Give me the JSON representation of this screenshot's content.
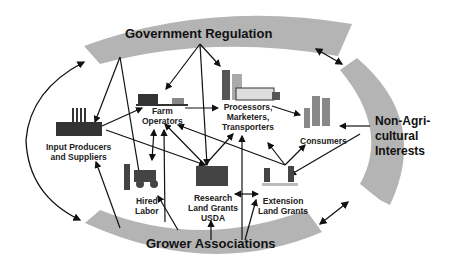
{
  "diagram": {
    "outer_groups": {
      "government": "Government Regulation",
      "grower": "Grower Associations",
      "non_ag_line1": "Non-Agri-",
      "non_ag_line2": "cultural",
      "non_ag_line3": "Interests"
    },
    "nodes": {
      "input_line1": "Input Producers",
      "input_line2": "and Suppliers",
      "farm_line1": "Farm",
      "farm_line2": "Operators",
      "proc_line1": "Processors,",
      "proc_line2": "Marketers,",
      "proc_line3": "Transporters",
      "consumers": "Consumers",
      "hired_line1": "Hired",
      "hired_line2": "Labor",
      "research_line1": "Research",
      "research_line2": "Land Grants",
      "research_line3": "USDA",
      "extension_line1": "Extension",
      "extension_line2": "Land Grants"
    },
    "icons": [
      "factory-icon",
      "barn-icon",
      "grain-elevator-truck-icon",
      "family-icon",
      "worker-tractor-icon",
      "research-building-icon",
      "extension-meeting-icon"
    ],
    "colors": {
      "band": "#b4b4b4",
      "arrow": "#111111"
    }
  }
}
